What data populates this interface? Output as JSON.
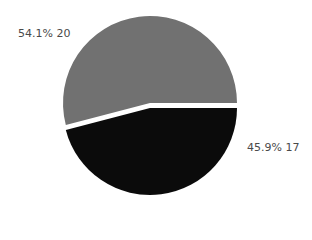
{
  "chart_data": {
    "type": "pie",
    "title": "",
    "categories": [
      "Slice A",
      "Slice B"
    ],
    "values": [
      20,
      17
    ],
    "percentages": [
      "54.1%",
      "45.9%"
    ],
    "colors": [
      "#717171",
      "#0b0b0b"
    ],
    "exploded": [
      false,
      true
    ],
    "legend": "none",
    "labels": [
      "54.1% 20",
      "45.9%  17"
    ]
  }
}
